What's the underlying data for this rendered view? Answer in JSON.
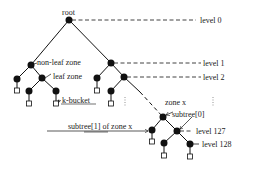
{
  "diagram": {
    "type": "tree",
    "colors": {
      "node": "#111111",
      "line": "#111111",
      "background": "#ffffff"
    },
    "labels": {
      "root": "root",
      "non_leaf_zone": "non-leaf zone",
      "leaf_zone": "leaf zone",
      "k_bucket": "k-bucket",
      "zone_x": "zone x",
      "subtree0": "subtree[0]",
      "subtree1": "subtree[1] of zone x",
      "ellipsis": "⋮"
    },
    "levels": [
      {
        "label": "level 0"
      },
      {
        "label": "level 1"
      },
      {
        "label": "level 2"
      },
      {
        "label": "level 127"
      },
      {
        "label": "level 128"
      }
    ]
  }
}
